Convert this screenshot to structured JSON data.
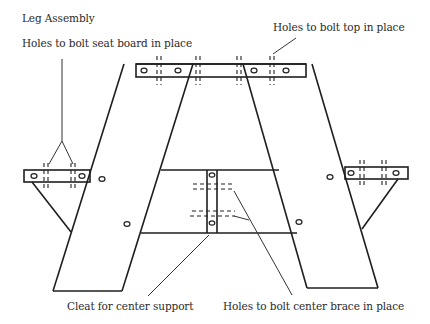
{
  "diagram": {
    "title": "Leg Assembly",
    "labels": {
      "seat_holes": "Holes to bolt seat board in place",
      "top_holes": "Holes to bolt top in place",
      "cleat": "Cleat for center support",
      "brace_holes": "Holes to bolt center brace in place"
    },
    "parts": [
      "top-board",
      "left-leg",
      "right-leg",
      "left-seat-cleat",
      "right-seat-cleat",
      "center-cleat",
      "left-brace",
      "right-brace"
    ],
    "colors": {
      "line": "#1e1e1e",
      "background": "#ffffff"
    }
  }
}
